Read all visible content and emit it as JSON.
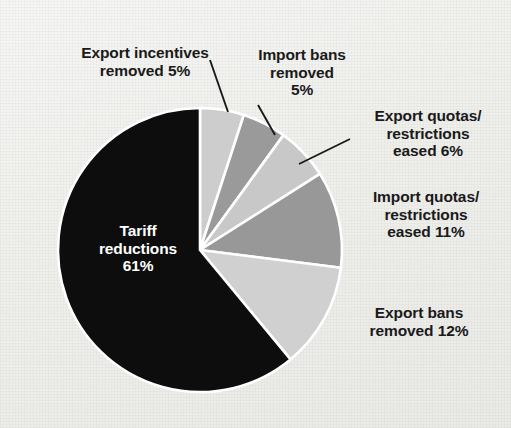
{
  "chart_data": {
    "type": "pie",
    "title": "",
    "subtitle": "",
    "xlabel": "",
    "ylabel": "",
    "legend_position": "none",
    "grid": false,
    "start_angle_deg": 0,
    "direction": "clockwise",
    "units": "percent",
    "total": 100,
    "categories": [
      "Export incentives removed",
      "Import bans removed",
      "Export quotas/restrictions eased",
      "Import quotas/restrictions eased",
      "Export bans removed",
      "Tariff reductions"
    ],
    "values": [
      5,
      5,
      6,
      11,
      12,
      61
    ],
    "colors": [
      "#cdcdcd",
      "#9a9a9a",
      "#c8c8c8",
      "#989898",
      "#d0d0d0",
      "#0d0d0d"
    ],
    "slices": [
      {
        "name": "export-incentives-removed",
        "label": "Export incentives\nremoved 5%",
        "value": 5,
        "value_text": "5%",
        "color": "#cdcdcd",
        "label_placement": "outside-leader"
      },
      {
        "name": "import-bans-removed",
        "label": "Import bans\nremoved\n5%",
        "value": 5,
        "value_text": "5%",
        "color": "#9a9a9a",
        "label_placement": "outside-leader"
      },
      {
        "name": "export-quotas-restrictions-eased",
        "label": "Export quotas/\nrestrictions\neased 6%",
        "value": 6,
        "value_text": "6%",
        "color": "#c8c8c8",
        "label_placement": "outside-leader"
      },
      {
        "name": "import-quotas-restrictions-eased",
        "label": "Import quotas/\nrestrictions\neased 11%",
        "value": 11,
        "value_text": "11%",
        "color": "#989898",
        "label_placement": "outside"
      },
      {
        "name": "export-bans-removed",
        "label": "Export bans\nremoved 12%",
        "value": 12,
        "value_text": "12%",
        "color": "#d0d0d0",
        "label_placement": "outside"
      },
      {
        "name": "tariff-reductions",
        "label": "Tariff\nreductions\n61%",
        "value": 61,
        "value_text": "61%",
        "color": "#0d0d0d",
        "label_placement": "inside"
      }
    ]
  },
  "figure": {
    "background_color": "#f0f0ed",
    "slice_separator_color": "#ffffff",
    "leader_line_color": "#1a1a1a",
    "inside_label_color": "#ffffff",
    "outside_label_color": "#1a1a1a"
  }
}
